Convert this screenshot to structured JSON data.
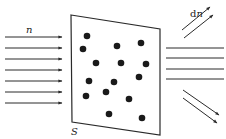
{
  "diagram": {
    "colors": {
      "stroke": "#2a2a2a",
      "dot": "#1a1a1a",
      "background": "#ffffff"
    },
    "labels": {
      "incident": "n",
      "scattered_prefix": "d",
      "scattered_var": "n",
      "surface": "S"
    },
    "plate": {
      "points": [
        [
          71,
          15
        ],
        [
          160,
          29
        ],
        [
          160,
          135
        ],
        [
          72,
          122
        ]
      ]
    },
    "incident_arrows": {
      "x1": 5,
      "x2": 62,
      "ys": [
        37,
        48,
        59,
        70,
        81,
        92,
        103
      ]
    },
    "transmitted_lines": {
      "x1": 166,
      "x2": 224,
      "ys": [
        48,
        58,
        69,
        79
      ]
    },
    "scattered_up": [
      {
        "x1": 182,
        "y1": 30,
        "x2": 210,
        "y2": 7
      },
      {
        "x1": 184,
        "y1": 38,
        "x2": 213,
        "y2": 15
      }
    ],
    "scattered_down": [
      {
        "x1": 183,
        "y1": 90,
        "x2": 219,
        "y2": 115
      },
      {
        "x1": 183,
        "y1": 98,
        "x2": 217,
        "y2": 123
      }
    ],
    "dots": [
      [
        87,
        36
      ],
      [
        83,
        49
      ],
      [
        117,
        46
      ],
      [
        141,
        43
      ],
      [
        96,
        63
      ],
      [
        121,
        63
      ],
      [
        146,
        64
      ],
      [
        89,
        81
      ],
      [
        114,
        82
      ],
      [
        139,
        77
      ],
      [
        86,
        96
      ],
      [
        106,
        92
      ],
      [
        129,
        99
      ],
      [
        109,
        114
      ],
      [
        142,
        118
      ]
    ]
  }
}
